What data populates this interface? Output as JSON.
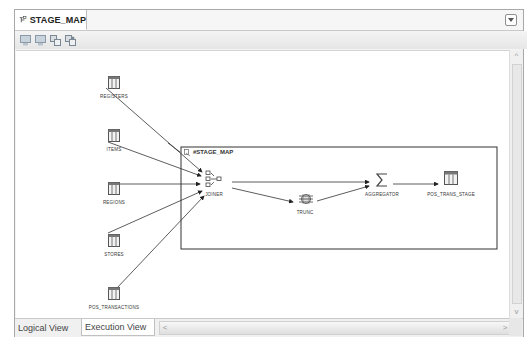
{
  "editor": {
    "tab_title": "STAGE_MAP",
    "tab_icon": "mapping-icon",
    "toolbar_buttons": [
      {
        "name": "toolbar-button-1",
        "icon": "diagram-icon"
      },
      {
        "name": "toolbar-button-2",
        "icon": "diagram-alt-icon"
      },
      {
        "name": "toolbar-button-3",
        "icon": "layout-icon"
      },
      {
        "name": "toolbar-button-4",
        "icon": "refresh-layout-icon"
      }
    ]
  },
  "diagram": {
    "sources": [
      {
        "label": "REGISTERS",
        "x": 114,
        "y": 72
      },
      {
        "label": "ITEMS",
        "x": 114,
        "y": 130
      },
      {
        "label": "REGIONS",
        "x": 114,
        "y": 183
      },
      {
        "label": "STORES",
        "x": 114,
        "y": 236
      },
      {
        "label": "POS_TRANSACTIONS",
        "x": 114,
        "y": 289
      }
    ],
    "execution_unit": {
      "label": "#STAGE_MAP"
    },
    "operators": [
      {
        "label": "JOINER",
        "icon": "joiner-icon"
      },
      {
        "label": "TRUNC",
        "icon": "expression-icon"
      },
      {
        "label": "AGGREGATOR",
        "icon": "sigma-icon"
      },
      {
        "label": "POS_TRANS_STAGE",
        "icon": "table-icon"
      }
    ]
  },
  "bottom_tabs": [
    {
      "label": "Logical View",
      "active": false
    },
    {
      "label": "Execution View",
      "active": true
    }
  ],
  "colors": {
    "line": "#333333",
    "border": "#a8a8a8",
    "canvas": "#ffffff"
  }
}
